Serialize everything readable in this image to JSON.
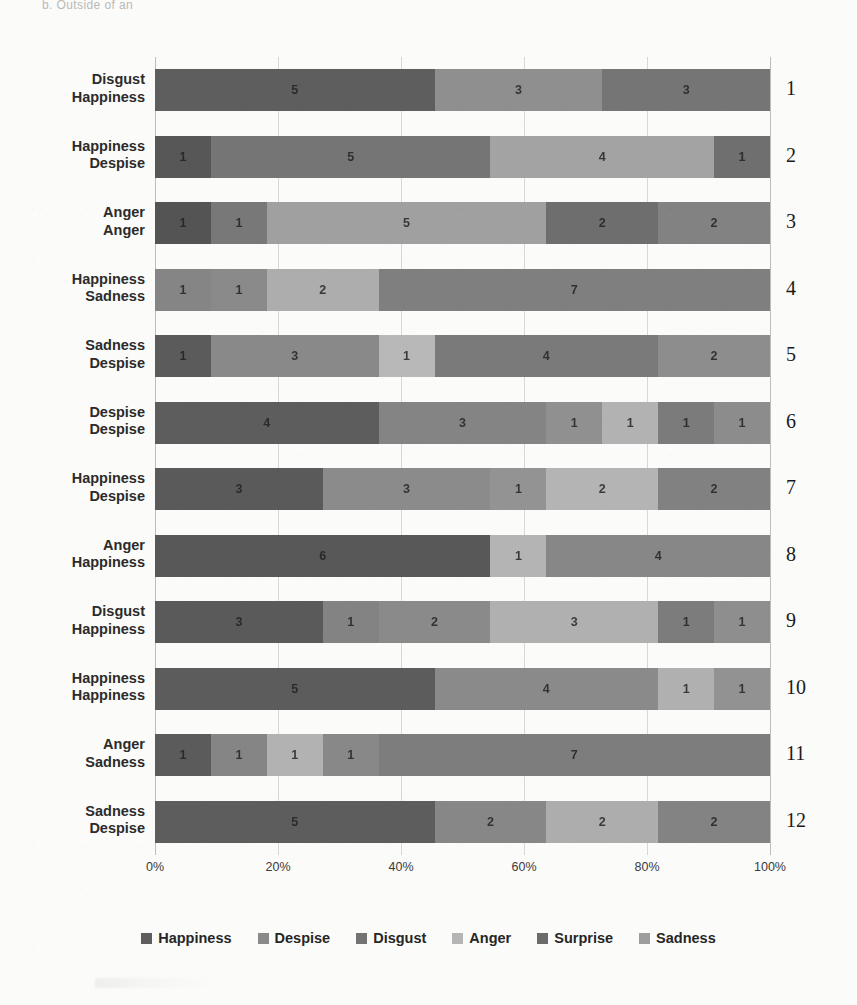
{
  "caption": "b. Outside of an",
  "legend": {
    "items": [
      {
        "label": "Happiness",
        "color": "#5e5e5e"
      },
      {
        "label": "Despise",
        "color": "#8a8a8a"
      },
      {
        "label": "Disgust",
        "color": "#737373"
      },
      {
        "label": "Anger",
        "color": "#b5b5b5"
      },
      {
        "label": "Surprise",
        "color": "#6b6b6b"
      },
      {
        "label": "Sadness",
        "color": "#9d9d9d"
      }
    ]
  },
  "chart_data": {
    "type": "bar",
    "title": "",
    "subtitle": "",
    "xlabel": "",
    "ylabel": "",
    "orientation": "horizontal",
    "stacked": true,
    "normalized_100_percent": true,
    "grid": true,
    "legend_position": "bottom",
    "xlim": [
      0,
      100
    ],
    "xticks": [
      "0%",
      "20%",
      "40%",
      "60%",
      "80%",
      "100%"
    ],
    "xtick_values": [
      0,
      20,
      40,
      60,
      80,
      100
    ],
    "row_numbers": [
      "1",
      "2",
      "3",
      "4",
      "5",
      "6",
      "7",
      "8",
      "9",
      "10",
      "11",
      "12"
    ],
    "categories": [
      "Disgust\nHappiness",
      "Happiness\nDespise",
      "Anger\nAnger",
      "Happiness\nSadness",
      "Sadness\nDespise",
      "Despise\nDespise",
      "Happiness\nDespise",
      "Anger\nHappiness",
      "Disgust\nHappiness",
      "Happiness\nHappiness",
      "Anger\nSadness",
      "Sadness\nDespise"
    ],
    "category_lines": [
      [
        "Disgust",
        "Happiness"
      ],
      [
        "Happiness",
        "Despise"
      ],
      [
        "Anger",
        "Anger"
      ],
      [
        "Happiness",
        "Sadness"
      ],
      [
        "Sadness",
        "Despise"
      ],
      [
        "Despise",
        "Despise"
      ],
      [
        "Happiness",
        "Despise"
      ],
      [
        "Anger",
        "Happiness"
      ],
      [
        "Disgust",
        "Happiness"
      ],
      [
        "Happiness",
        "Happiness"
      ],
      [
        "Anger",
        "Sadness"
      ],
      [
        "Sadness",
        "Despise"
      ]
    ],
    "series": [
      {
        "name": "Happiness",
        "color": "#5e5e5e",
        "values": [
          5,
          1,
          1,
          1,
          1,
          4,
          3,
          6,
          3,
          5,
          1,
          5
        ]
      },
      {
        "name": "Despise",
        "color": "#8a8a8a",
        "values": [
          3,
          5,
          1,
          1,
          3,
          3,
          3,
          0,
          1,
          4,
          1,
          2
        ]
      },
      {
        "name": "Disgust",
        "color": "#737373",
        "values": [
          3,
          4,
          5,
          2,
          1,
          1,
          1,
          1,
          2,
          1,
          1,
          2
        ]
      },
      {
        "name": "Anger",
        "color": "#b5b5b5",
        "values": [
          0,
          1,
          2,
          7,
          4,
          1,
          2,
          4,
          3,
          1,
          1,
          2
        ]
      },
      {
        "name": "Surprise",
        "color": "#6b6b6b",
        "values": [
          0,
          0,
          2,
          0,
          2,
          1,
          2,
          0,
          1,
          0,
          7,
          0
        ]
      },
      {
        "name": "Sadness",
        "color": "#9d9d9d",
        "values": [
          0,
          0,
          0,
          0,
          0,
          1,
          0,
          0,
          1,
          0,
          0,
          0
        ]
      }
    ],
    "row_total": 11,
    "rows": [
      {
        "number": "1",
        "label_lines": [
          "Disgust",
          "Happiness"
        ],
        "total": 11,
        "segments": [
          {
            "name": "Happiness",
            "value": 5,
            "color": "#5e5e5e",
            "label": "5"
          },
          {
            "name": "Despise",
            "value": 3,
            "color": "#8f8f8f",
            "label": "3"
          },
          {
            "name": "Disgust",
            "value": 3,
            "color": "#757575",
            "label": "3"
          }
        ]
      },
      {
        "number": "2",
        "label_lines": [
          "Happiness",
          "Despise"
        ],
        "total": 11,
        "segments": [
          {
            "name": "Happiness",
            "value": 1,
            "color": "#575757",
            "label": "1"
          },
          {
            "name": "Despise",
            "value": 5,
            "color": "#757575",
            "label": "5"
          },
          {
            "name": "Disgust",
            "value": 4,
            "color": "#a3a3a3",
            "label": "4"
          },
          {
            "name": "Anger",
            "value": 1,
            "color": "#6f6f6f",
            "label": "1"
          }
        ]
      },
      {
        "number": "3",
        "label_lines": [
          "Anger",
          "Anger"
        ],
        "total": 11,
        "segments": [
          {
            "name": "Happiness",
            "value": 1,
            "color": "#545454",
            "label": "1"
          },
          {
            "name": "Despise",
            "value": 1,
            "color": "#787878",
            "label": "1"
          },
          {
            "name": "Disgust",
            "value": 5,
            "color": "#a0a0a0",
            "label": "5"
          },
          {
            "name": "Anger",
            "value": 2,
            "color": "#6e6e6e",
            "label": "2"
          },
          {
            "name": "Surprise",
            "value": 2,
            "color": "#828282",
            "label": "2"
          }
        ]
      },
      {
        "number": "4",
        "label_lines": [
          "Happiness",
          "Sadness"
        ],
        "total": 11,
        "segments": [
          {
            "name": "Happiness",
            "value": 1,
            "color": "#858585",
            "label": "1"
          },
          {
            "name": "Despise",
            "value": 1,
            "color": "#8a8a8a",
            "label": "1"
          },
          {
            "name": "Disgust",
            "value": 2,
            "color": "#adadad",
            "label": "2"
          },
          {
            "name": "Anger",
            "value": 7,
            "color": "#7f7f7f",
            "label": "7"
          }
        ]
      },
      {
        "number": "5",
        "label_lines": [
          "Sadness",
          "Despise"
        ],
        "total": 11,
        "segments": [
          {
            "name": "Happiness",
            "value": 1,
            "color": "#5b5b5b",
            "label": "1"
          },
          {
            "name": "Despise",
            "value": 3,
            "color": "#898989",
            "label": "3"
          },
          {
            "name": "Disgust",
            "value": 1,
            "color": "#b8b8b8",
            "label": "1"
          },
          {
            "name": "Anger",
            "value": 4,
            "color": "#7a7a7a",
            "label": "4"
          },
          {
            "name": "Surprise",
            "value": 2,
            "color": "#8d8d8d",
            "label": "2"
          }
        ]
      },
      {
        "number": "6",
        "label_lines": [
          "Despise",
          "Despise"
        ],
        "total": 11,
        "segments": [
          {
            "name": "Happiness",
            "value": 4,
            "color": "#5d5d5d",
            "label": "4"
          },
          {
            "name": "Despise",
            "value": 3,
            "color": "#848484",
            "label": "3"
          },
          {
            "name": "Disgust",
            "value": 1,
            "color": "#909090",
            "label": "1"
          },
          {
            "name": "Anger",
            "value": 1,
            "color": "#b2b2b2",
            "label": "1"
          },
          {
            "name": "Surprise",
            "value": 1,
            "color": "#7b7b7b",
            "label": "1"
          },
          {
            "name": "Sadness",
            "value": 1,
            "color": "#8c8c8c",
            "label": "1"
          }
        ]
      },
      {
        "number": "7",
        "label_lines": [
          "Happiness",
          "Despise"
        ],
        "total": 11,
        "segments": [
          {
            "name": "Happiness",
            "value": 3,
            "color": "#5a5a5a",
            "label": "3"
          },
          {
            "name": "Despise",
            "value": 3,
            "color": "#8b8b8b",
            "label": "3"
          },
          {
            "name": "Disgust",
            "value": 1,
            "color": "#939393",
            "label": "1"
          },
          {
            "name": "Anger",
            "value": 2,
            "color": "#b4b4b4",
            "label": "2"
          },
          {
            "name": "Surprise",
            "value": 2,
            "color": "#818181",
            "label": "2"
          }
        ]
      },
      {
        "number": "8",
        "label_lines": [
          "Anger",
          "Happiness"
        ],
        "total": 11,
        "segments": [
          {
            "name": "Happiness",
            "value": 6,
            "color": "#585858",
            "label": "6"
          },
          {
            "name": "Anger",
            "value": 1,
            "color": "#b4b4b4",
            "label": "1"
          },
          {
            "name": "Disgust",
            "value": 4,
            "color": "#878787",
            "label": "4"
          }
        ]
      },
      {
        "number": "9",
        "label_lines": [
          "Disgust",
          "Happiness"
        ],
        "total": 11,
        "segments": [
          {
            "name": "Happiness",
            "value": 3,
            "color": "#5a5a5a",
            "label": "3"
          },
          {
            "name": "Despise",
            "value": 1,
            "color": "#838383",
            "label": "1"
          },
          {
            "name": "Disgust",
            "value": 2,
            "color": "#8a8a8a",
            "label": "2"
          },
          {
            "name": "Anger",
            "value": 3,
            "color": "#b0b0b0",
            "label": "3"
          },
          {
            "name": "Surprise",
            "value": 1,
            "color": "#7c7c7c",
            "label": "1"
          },
          {
            "name": "Sadness",
            "value": 1,
            "color": "#8e8e8e",
            "label": "1"
          }
        ]
      },
      {
        "number": "10",
        "label_lines": [
          "Happiness",
          "Happiness"
        ],
        "total": 11,
        "segments": [
          {
            "name": "Happiness",
            "value": 5,
            "color": "#5c5c5c",
            "label": "5"
          },
          {
            "name": "Despise",
            "value": 4,
            "color": "#8a8a8a",
            "label": "4"
          },
          {
            "name": "Disgust",
            "value": 1,
            "color": "#b0b0b0",
            "label": "1"
          },
          {
            "name": "Anger",
            "value": 1,
            "color": "#929292",
            "label": "1"
          }
        ]
      },
      {
        "number": "11",
        "label_lines": [
          "Anger",
          "Sadness"
        ],
        "total": 11,
        "segments": [
          {
            "name": "Happiness",
            "value": 1,
            "color": "#5b5b5b",
            "label": "1"
          },
          {
            "name": "Despise",
            "value": 1,
            "color": "#858585",
            "label": "1"
          },
          {
            "name": "Disgust",
            "value": 1,
            "color": "#b2b2b2",
            "label": "1"
          },
          {
            "name": "Anger",
            "value": 1,
            "color": "#888888",
            "label": "1"
          },
          {
            "name": "Surprise",
            "value": 7,
            "color": "#7d7d7d",
            "label": "7"
          }
        ]
      },
      {
        "number": "12",
        "label_lines": [
          "Sadness",
          "Despise"
        ],
        "total": 11,
        "segments": [
          {
            "name": "Happiness",
            "value": 5,
            "color": "#5d5d5d",
            "label": "5"
          },
          {
            "name": "Despise",
            "value": 2,
            "color": "#878787",
            "label": "2"
          },
          {
            "name": "Disgust",
            "value": 2,
            "color": "#adadad",
            "label": "2"
          },
          {
            "name": "Anger",
            "value": 2,
            "color": "#838383",
            "label": "2"
          }
        ]
      }
    ]
  }
}
